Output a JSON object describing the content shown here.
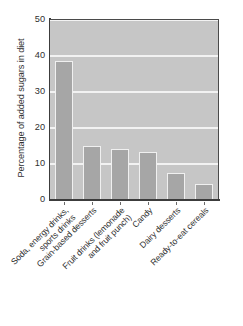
{
  "chart_data": {
    "type": "bar",
    "title": "",
    "subtitle": "",
    "xlabel": "",
    "ylabel": "Percentage of added sugars in diet",
    "ylim": [
      0,
      50
    ],
    "ytick_values": [
      0,
      10,
      20,
      30,
      40,
      50
    ],
    "ytick_labels": [
      "0",
      "10",
      "20",
      "30",
      "40",
      "50"
    ],
    "grid": "horizontal",
    "legend": "none",
    "categories": [
      "Soda, energy drinks,\nsports drinks",
      "Grain-based desserts",
      "Fruit drinks (lemonade\nand fruit punch)",
      "Candy",
      "Dairy desserts",
      "Ready-to-eat cereals"
    ],
    "values": [
      38.6,
      14.9,
      14.3,
      13.4,
      7.4,
      4.5
    ],
    "colors": {
      "bar_fill": "#a6a6a6",
      "bar_edge": "#f0f0f0",
      "plot_background": "#c6c6c6",
      "gridline": "#f2f2f2",
      "axis_line": "#3c3c3c",
      "text": "#2f2f2f",
      "figure_background": "#ffffff"
    }
  }
}
